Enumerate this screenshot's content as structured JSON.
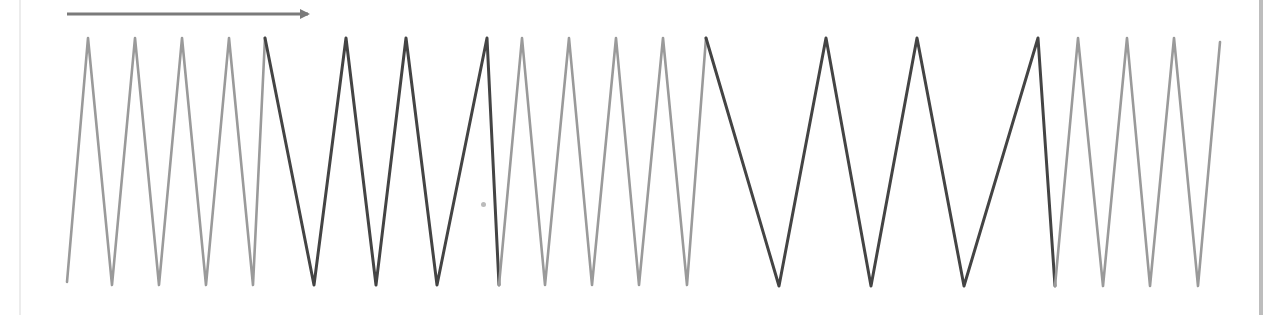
{
  "diagram": {
    "type": "zigzag-waveform",
    "direction_arrow": {
      "x1": 67,
      "y1": 14,
      "x2": 314,
      "y2": 14,
      "color": "#7a7a7a"
    },
    "colors": {
      "light": "#9a9a9a",
      "dark": "#444444",
      "right_border": "#bdbdbd",
      "left_border": "#ececec"
    },
    "top_y": 38,
    "bottom_y": 285,
    "segments": [
      {
        "tone": "light",
        "points": [
          [
            67,
            282
          ],
          [
            88,
            38
          ],
          [
            112,
            285
          ],
          [
            135,
            38
          ],
          [
            159,
            285
          ],
          [
            182,
            38
          ],
          [
            206,
            285
          ],
          [
            229,
            38
          ],
          [
            253,
            285
          ],
          [
            265,
            38
          ]
        ]
      },
      {
        "tone": "dark",
        "points": [
          [
            265,
            38
          ],
          [
            314,
            285
          ],
          [
            346,
            38
          ],
          [
            376,
            285
          ],
          [
            406,
            38
          ],
          [
            437,
            285
          ],
          [
            487,
            38
          ],
          [
            499,
            285
          ]
        ]
      },
      {
        "tone": "light",
        "points": [
          [
            499,
            285
          ],
          [
            522,
            38
          ],
          [
            545,
            285
          ],
          [
            569,
            38
          ],
          [
            592,
            285
          ],
          [
            616,
            38
          ],
          [
            639,
            285
          ],
          [
            663,
            38
          ],
          [
            687,
            285
          ],
          [
            706,
            38
          ]
        ]
      },
      {
        "tone": "dark",
        "points": [
          [
            706,
            38
          ],
          [
            779,
            286
          ],
          [
            826,
            38
          ],
          [
            871,
            286
          ],
          [
            917,
            38
          ],
          [
            964,
            286
          ],
          [
            1038,
            38
          ],
          [
            1055,
            286
          ]
        ]
      },
      {
        "tone": "light",
        "points": [
          [
            1055,
            286
          ],
          [
            1078,
            38
          ],
          [
            1103,
            286
          ],
          [
            1127,
            38
          ],
          [
            1150,
            286
          ],
          [
            1174,
            38
          ],
          [
            1198,
            286
          ],
          [
            1220,
            42
          ]
        ]
      }
    ],
    "speck": {
      "x": 481,
      "y": 202
    }
  }
}
